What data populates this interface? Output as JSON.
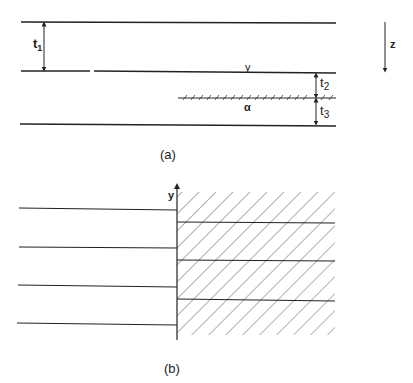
{
  "panel_a": {
    "caption": "(a)",
    "thickness_labels": {
      "t1": "t",
      "t1_sub": "1",
      "t2": "t",
      "t2_sub": "2",
      "t3": "t",
      "t3_sub": "3"
    },
    "interface_labels": {
      "gamma": "γ",
      "alpha": "α"
    },
    "axis_label": "z"
  },
  "panel_b": {
    "caption": "(b)",
    "axis_label": "y"
  },
  "colors": {
    "ink": "#222222",
    "hatch": "#555555",
    "background": "#ffffff"
  }
}
